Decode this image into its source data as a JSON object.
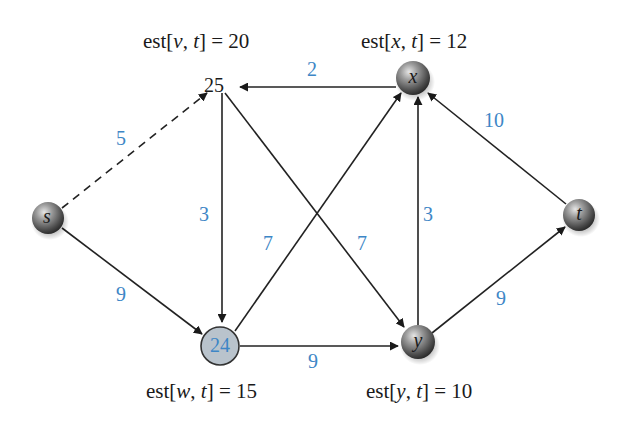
{
  "diagram": {
    "type": "weighted directed graph",
    "nodes": [
      {
        "id": "s",
        "label": "s",
        "style": "sphere",
        "x": 48,
        "y": 218
      },
      {
        "id": "v",
        "label": "25",
        "style": "text-only",
        "x": 222,
        "y": 88
      },
      {
        "id": "x",
        "label": "x",
        "style": "sphere",
        "x": 413,
        "y": 78
      },
      {
        "id": "t",
        "label": "t",
        "style": "sphere",
        "x": 579,
        "y": 215
      },
      {
        "id": "w",
        "label": "24",
        "style": "highlighted-circle",
        "x": 220,
        "y": 346
      },
      {
        "id": "y",
        "label": "y",
        "style": "sphere",
        "x": 418,
        "y": 342
      }
    ],
    "edges": [
      {
        "from": "s",
        "to": "v",
        "weight": "5",
        "style": "dashed"
      },
      {
        "from": "s",
        "to": "w",
        "weight": "9",
        "style": "solid"
      },
      {
        "from": "x",
        "to": "v",
        "weight": "2",
        "style": "solid"
      },
      {
        "from": "v",
        "to": "w",
        "weight": "3",
        "style": "solid"
      },
      {
        "from": "v",
        "to": "y",
        "weight": "7",
        "style": "solid"
      },
      {
        "from": "w",
        "to": "x",
        "weight": "7",
        "style": "solid"
      },
      {
        "from": "w",
        "to": "y",
        "weight": "9",
        "style": "solid"
      },
      {
        "from": "y",
        "to": "x",
        "weight": "3",
        "style": "solid"
      },
      {
        "from": "t",
        "to": "x",
        "weight": "10",
        "style": "solid"
      },
      {
        "from": "y",
        "to": "t",
        "weight": "9",
        "style": "solid"
      }
    ],
    "estimates": {
      "v": {
        "prefix": "est[",
        "var": "v",
        "sep": ", ",
        "target": "t",
        "suffix": "] = 20"
      },
      "x": {
        "prefix": "est[",
        "var": "x",
        "sep": ", ",
        "target": "t",
        "suffix": "] = 12"
      },
      "w": {
        "prefix": "est[",
        "var": "w",
        "sep": ", ",
        "target": "t",
        "suffix": "] = 15"
      },
      "y": {
        "prefix": "est[",
        "var": "y",
        "sep": ", ",
        "target": "t",
        "suffix": "] = 10"
      }
    },
    "colors": {
      "weight_label": "#3d86c6",
      "edge": "#222222",
      "highlight_fill": "#b9c3cc",
      "sphere_base": "#6e6e6e"
    }
  }
}
